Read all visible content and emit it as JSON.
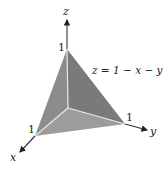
{
  "diagram": {
    "equation": "z = 1 − x − y",
    "axes": {
      "x": "x",
      "y": "y",
      "z": "z"
    },
    "intercepts": {
      "x": "1",
      "y": "1",
      "z": "1"
    },
    "colors": {
      "face_left": "#8a8a8a",
      "face_right": "#777777",
      "face_bottom": "#9a9a9a",
      "edges": "#e6e6e6",
      "axis": "#333333"
    }
  }
}
